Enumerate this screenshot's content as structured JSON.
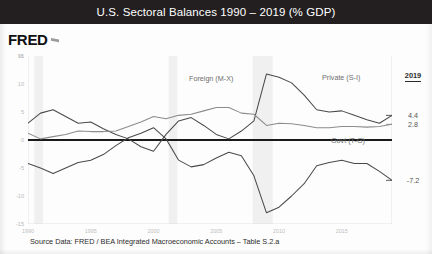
{
  "header": {
    "title": "U.S. Sectoral Balances 1990 – 2019 (% GDP)",
    "background_color": "#231f20",
    "text_color": "#ffffff"
  },
  "logo": {
    "text": "FRED",
    "mark": "fred-flag-mark"
  },
  "footer": {
    "source_text": "Source Data:  FRED / BEA Integrated Macroeconomic Accounts – Table S.2.a"
  },
  "value_column": {
    "heading": "2019",
    "items": [
      {
        "series": "Private (S-I)",
        "value": "4.4"
      },
      {
        "series": "Foreign (M-X)",
        "value": "2.8"
      },
      {
        "series": "Govt (T-G)",
        "value": "-7.2"
      }
    ]
  },
  "chart_data": {
    "type": "line",
    "title": "U.S. Sectoral Balances 1990 – 2019 (% GDP)",
    "xlabel": "",
    "ylabel": "%",
    "y_unit_label": "%",
    "xlim": [
      1990,
      2019
    ],
    "ylim": [
      -15,
      15
    ],
    "yticks": [
      15,
      10,
      5,
      0,
      -5,
      -10,
      -15
    ],
    "ytick_labels": [
      "15",
      "10",
      "5",
      "0",
      "-5",
      "-10",
      "-15"
    ],
    "xticks": [
      1990,
      1995,
      2000,
      2005,
      2010,
      2015
    ],
    "xtick_labels": [
      "1990",
      "1995",
      "2000",
      "2005",
      "2010",
      "2015"
    ],
    "grid": false,
    "zero_line": true,
    "zero_line_color": "#1a1a1a",
    "legend_position": "inline-annotations",
    "recession_bands": [
      {
        "start": 1990.5,
        "end": 1991.2
      },
      {
        "start": 2001.2,
        "end": 2001.9
      },
      {
        "start": 2007.9,
        "end": 2009.5
      }
    ],
    "x": [
      1990,
      1991,
      1992,
      1993,
      1994,
      1995,
      1996,
      1997,
      1998,
      1999,
      2000,
      2001,
      2002,
      2003,
      2004,
      2005,
      2006,
      2007,
      2008,
      2009,
      2010,
      2011,
      2012,
      2013,
      2014,
      2015,
      2016,
      2017,
      2018,
      2019
    ],
    "series": [
      {
        "name": "Private (S-I)",
        "label": "Private (S-I)",
        "color": "#4a4a4a",
        "values": [
          3.0,
          4.8,
          5.4,
          4.2,
          3.0,
          3.2,
          2.0,
          1.0,
          0.2,
          -1.2,
          -2.0,
          1.0,
          3.4,
          4.0,
          2.6,
          1.0,
          0.2,
          1.6,
          3.4,
          11.8,
          11.2,
          10.2,
          8.0,
          5.4,
          5.0,
          5.2,
          4.4,
          3.6,
          3.0,
          4.4
        ]
      },
      {
        "name": "Foreign (M-X)",
        "label": "Foreign (M-X)",
        "color": "#8c8c8c",
        "values": [
          1.2,
          0.2,
          0.6,
          1.0,
          1.6,
          1.5,
          1.5,
          1.6,
          2.4,
          3.2,
          4.2,
          3.8,
          4.4,
          4.6,
          5.2,
          5.8,
          5.8,
          4.8,
          4.6,
          2.6,
          3.0,
          2.9,
          2.6,
          2.2,
          2.2,
          2.4,
          2.4,
          2.3,
          2.4,
          2.8
        ]
      },
      {
        "name": "Govt (T-G)",
        "label": "Govt (T-G)",
        "color": "#4a4a4a",
        "values": [
          -4.2,
          -5.0,
          -6.0,
          -5.0,
          -4.0,
          -3.6,
          -2.6,
          -1.0,
          0.4,
          1.2,
          2.2,
          0.2,
          -3.6,
          -4.8,
          -4.4,
          -3.2,
          -2.2,
          -2.8,
          -6.4,
          -13.0,
          -12.0,
          -10.0,
          -7.8,
          -4.6,
          -4.0,
          -3.6,
          -4.2,
          -4.2,
          -5.6,
          -7.2
        ]
      }
    ]
  }
}
